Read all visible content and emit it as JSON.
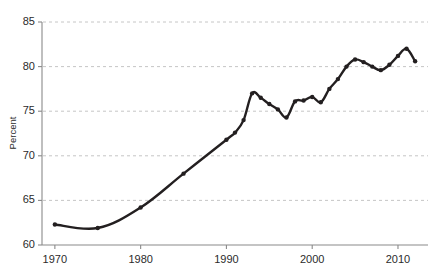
{
  "chart_data": {
    "type": "line",
    "title": "",
    "subtitle": "",
    "xlabel": "",
    "ylabel": "Percent",
    "xlim": [
      1968.5,
      2013.5
    ],
    "ylim": [
      60,
      85
    ],
    "grid": true,
    "grid_axis": "y",
    "legend": false,
    "legend_position": "none",
    "line_color": "#231f20",
    "grid_color": "#bfbfbf",
    "axis_color": "#8a8a8a",
    "x_ticks": [
      1970,
      1980,
      1990,
      2000,
      2010
    ],
    "x_tick_labels": [
      "1970",
      "1980",
      "1990",
      "2000",
      "2010"
    ],
    "y_ticks": [
      60,
      65,
      70,
      75,
      80,
      85
    ],
    "y_tick_labels": [
      "60",
      "65",
      "70",
      "75",
      "80",
      "85"
    ],
    "series": [
      {
        "name": "Percent",
        "x": [
          1970,
          1975,
          1980,
          1985,
          1990,
          1991,
          1992,
          1993,
          1994,
          1995,
          1996,
          1997,
          1998,
          1999,
          2000,
          2001,
          2002,
          2003,
          2004,
          2005,
          2006,
          2007,
          2008,
          2009,
          2010,
          2011,
          2012
        ],
        "values": [
          62.3,
          61.9,
          64.2,
          68.0,
          71.8,
          72.6,
          74.0,
          77.0,
          76.5,
          75.8,
          75.2,
          74.3,
          76.1,
          76.2,
          76.6,
          76.0,
          77.5,
          78.6,
          80.0,
          80.8,
          80.5,
          80.0,
          79.6,
          80.2,
          81.2,
          82.0,
          80.6
        ]
      }
    ],
    "markers": [
      {
        "x": 1970,
        "y": 62.3
      },
      {
        "x": 1975,
        "y": 61.9
      },
      {
        "x": 1980,
        "y": 64.2
      },
      {
        "x": 1985,
        "y": 68.0
      },
      {
        "x": 1990,
        "y": 71.8
      },
      {
        "x": 1991,
        "y": 72.6
      },
      {
        "x": 1992,
        "y": 74.0
      },
      {
        "x": 1993,
        "y": 77.0
      },
      {
        "x": 1994,
        "y": 76.5
      },
      {
        "x": 1995,
        "y": 75.8
      },
      {
        "x": 1996,
        "y": 75.2
      },
      {
        "x": 1997,
        "y": 74.3
      },
      {
        "x": 1998,
        "y": 76.1
      },
      {
        "x": 1999,
        "y": 76.2
      },
      {
        "x": 2000,
        "y": 76.6
      },
      {
        "x": 2001,
        "y": 76.0
      },
      {
        "x": 2002,
        "y": 77.5
      },
      {
        "x": 2003,
        "y": 78.6
      },
      {
        "x": 2004,
        "y": 80.0
      },
      {
        "x": 2005,
        "y": 80.8
      },
      {
        "x": 2006,
        "y": 80.5
      },
      {
        "x": 2007,
        "y": 80.0
      },
      {
        "x": 2008,
        "y": 79.6
      },
      {
        "x": 2009,
        "y": 80.2
      },
      {
        "x": 2010,
        "y": 81.2
      },
      {
        "x": 2011,
        "y": 82.0
      },
      {
        "x": 2012,
        "y": 80.6
      }
    ]
  },
  "plot_geometry": {
    "left": 42,
    "right": 428,
    "top": 22,
    "bottom": 245
  }
}
